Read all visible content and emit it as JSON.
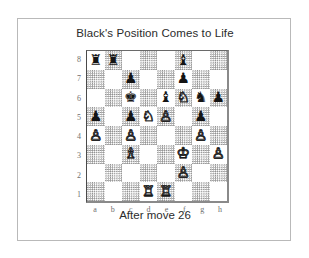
{
  "figure": {
    "title": "Black's Position Comes to Life",
    "caption": "After move 26"
  },
  "board": {
    "rank_labels": [
      "8",
      "7",
      "6",
      "5",
      "4",
      "3",
      "2",
      "1"
    ],
    "file_labels": [
      "a",
      "b",
      "c",
      "d",
      "e",
      "f",
      "g",
      "h"
    ],
    "light_square_color": "#ffffff",
    "dark_square_color": "#8f8f8f",
    "black_piece_color": "#141414",
    "white_piece_color": "#ffffff",
    "orientation": "white-bottom",
    "glyphs": {
      "white-king": "♔",
      "white-queen": "♕",
      "white-rook": "♖",
      "white-bishop": "♗",
      "white-knight": "♘",
      "white-pawn": "♙",
      "black-king": "♚",
      "black-queen": "♛",
      "black-rook": "♜",
      "black-bishop": "♝",
      "black-knight": "♞",
      "black-pawn": "♟"
    },
    "pieces": {
      "a8": "black-rook",
      "b8": "black-rook",
      "f8": "black-bishop",
      "c7": "black-pawn",
      "f7": "black-pawn",
      "c6": "black-king",
      "e6": "black-bishop",
      "f6": "white-knight",
      "g6": "black-knight",
      "h6": "black-pawn",
      "a5": "black-pawn",
      "c5": "black-pawn",
      "d5": "white-knight",
      "e5": "white-pawn",
      "g5": "black-pawn",
      "a4": "white-pawn",
      "c4": "white-pawn",
      "g4": "white-pawn",
      "c3": "white-bishop",
      "f3": "white-king",
      "h3": "white-pawn",
      "f2": "white-pawn",
      "d1": "white-rook",
      "e1": "white-rook"
    }
  }
}
